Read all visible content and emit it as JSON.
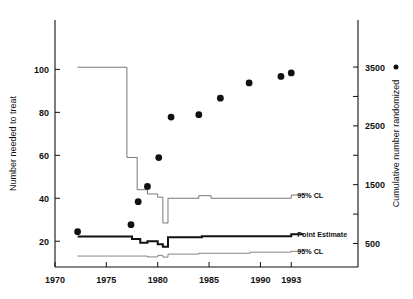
{
  "chart_data": {
    "type": "line",
    "title": "",
    "subtitle": "",
    "xlabel": "",
    "ylabel": "Number needed to treat",
    "y2label": "Cumulative number randomized",
    "xlim": [
      1970,
      1999.5
    ],
    "ylim": [
      8,
      123
    ],
    "y2lim": [
      100,
      4300
    ],
    "grid": false,
    "legend_position": "inline-right",
    "xticks": [
      1970,
      1975,
      1980,
      1985,
      1990,
      1993
    ],
    "xticklabels": [
      "1970",
      "1975",
      "1980",
      "1985",
      "1990",
      "1993"
    ],
    "yticks": [
      20,
      40,
      60,
      80,
      100
    ],
    "yticklabels": [
      "20",
      "40",
      "60",
      "80",
      "100"
    ],
    "y2ticks": [
      500,
      1000,
      1500,
      2000,
      2500,
      3000,
      3500
    ],
    "y2ticklabels": [
      "500",
      "",
      "1500",
      "",
      "2500",
      "",
      "3500"
    ],
    "series": [
      {
        "name": "95% CL",
        "kind": "step-upper",
        "axis": "left",
        "label": "95% CL",
        "label_x": 1993.2,
        "label_y": 41.5,
        "color": "#555555",
        "linewidth": 0.8,
        "x": [
          1972.2,
          1977.0,
          1977.0,
          1978.0,
          1978.0,
          1979.0,
          1979.0,
          1980.0,
          1980.0,
          1980.5,
          1980.5,
          1981.0,
          1981.0,
          1984.0,
          1984.0,
          1985.2,
          1985.2,
          1993.0,
          1993.0,
          1994.2
        ],
        "y": [
          101.0,
          101.0,
          59.0,
          59.0,
          44.0,
          44.0,
          42.0,
          42.0,
          40.5,
          40.5,
          28.5,
          28.5,
          40.0,
          40.0,
          41.2,
          41.2,
          40.0,
          40.0,
          41.5,
          41.5
        ]
      },
      {
        "name": "Point Estimate",
        "kind": "step-mid",
        "axis": "left",
        "label": "Point Estimate",
        "label_x": 1993.2,
        "label_y": 23.2,
        "color": "#111111",
        "linewidth": 2.0,
        "x": [
          1972.2,
          1977.5,
          1977.5,
          1978.3,
          1978.3,
          1979.0,
          1979.0,
          1980.0,
          1980.0,
          1980.5,
          1980.5,
          1981.0,
          1981.0,
          1984.3,
          1984.3,
          1993.0,
          1993.0,
          1994.2
        ],
        "y": [
          22.2,
          22.2,
          21.0,
          21.0,
          19.3,
          19.3,
          20.0,
          20.0,
          18.6,
          18.6,
          17.4,
          17.4,
          21.8,
          21.8,
          22.3,
          22.3,
          23.2,
          23.2
        ]
      },
      {
        "name": "95% CL",
        "kind": "step-lower",
        "axis": "left",
        "label": "95% CL",
        "label_x": 1993.2,
        "label_y": 15.3,
        "color": "#666666",
        "linewidth": 0.8,
        "x": [
          1972.2,
          1979.0,
          1979.0,
          1980.0,
          1980.0,
          1980.5,
          1980.5,
          1981.0,
          1981.0,
          1984.0,
          1984.0,
          1989.0,
          1989.0,
          1993.0,
          1993.0,
          1994.2
        ],
        "y": [
          13.1,
          13.1,
          12.7,
          12.7,
          13.4,
          13.4,
          12.6,
          12.6,
          14.0,
          14.0,
          14.4,
          14.4,
          14.9,
          14.9,
          15.3,
          15.3
        ]
      }
    ],
    "scatter": {
      "name": "Cumulative number randomized",
      "axis": "right",
      "marker": "filled-circle",
      "color": "#111111",
      "size": 3.4,
      "points": [
        {
          "x": 1972.2,
          "y": 700
        },
        {
          "x": 1977.4,
          "y": 820
        },
        {
          "x": 1978.1,
          "y": 1210
        },
        {
          "x": 1979.0,
          "y": 1470
        },
        {
          "x": 1980.1,
          "y": 1960
        },
        {
          "x": 1981.3,
          "y": 2650
        },
        {
          "x": 1984.0,
          "y": 2690
        },
        {
          "x": 1986.1,
          "y": 2970
        },
        {
          "x": 1988.9,
          "y": 3230
        },
        {
          "x": 1992.0,
          "y": 3340
        },
        {
          "x": 1993.0,
          "y": 3400
        }
      ]
    },
    "legend_marker": {
      "symbol": "•",
      "x": 1999.0,
      "y2": 3500
    }
  }
}
